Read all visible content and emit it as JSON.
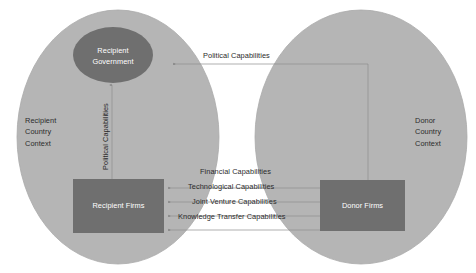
{
  "diagram": {
    "colors": {
      "ellipse_fill": "#b4b4b4",
      "ellipse_stroke": "#a8a8a8",
      "box_fill": "#6e6e6e",
      "circle_fill": "#6e6e6e",
      "line": "#8f8f8f",
      "text_dark": "#2b2b2b",
      "text_light": "#ffffff",
      "background": "#ffffff"
    },
    "containers": [
      {
        "id": "recipient-country-context",
        "label": "Recipient\nCountry\nContext",
        "label_lines": [
          "Recipient",
          "Country",
          "Context"
        ],
        "shape": "ellipse"
      },
      {
        "id": "donor-country-context",
        "label": "Donor\nCountry\nContext",
        "label_lines": [
          "Donor",
          "Country",
          "Context"
        ],
        "shape": "ellipse"
      }
    ],
    "nodes": [
      {
        "id": "recipient-government",
        "label_lines": [
          "Recipient",
          "Government"
        ],
        "shape": "ellipse"
      },
      {
        "id": "recipient-firms",
        "label_lines": [
          "Recipient Firms"
        ],
        "shape": "rectangle"
      },
      {
        "id": "donor-firms",
        "label_lines": [
          "Donor Firms"
        ],
        "shape": "rectangle"
      }
    ],
    "flows": [
      {
        "id": "political-capabilities-top",
        "label": "Political Capabilities",
        "from": "donor-country-context",
        "to": "recipient-government",
        "orientation": "horizontal"
      },
      {
        "id": "political-capabilities-vertical",
        "label": "Political Capabilities",
        "from": "recipient-firms",
        "to": "recipient-government",
        "orientation": "vertical"
      },
      {
        "id": "financial-capabilities",
        "label": "Financial Capabilities",
        "from": "donor-firms",
        "to": "recipient-firms",
        "orientation": "horizontal"
      },
      {
        "id": "technological-capabilities",
        "label": "Technological  Capabilities",
        "from": "donor-firms",
        "to": "recipient-firms",
        "orientation": "horizontal"
      },
      {
        "id": "joint-venture-capabilities",
        "label": "Joint Venture Capabilities",
        "from": "donor-firms",
        "to": "recipient-firms",
        "orientation": "horizontal"
      },
      {
        "id": "knowledge-transfer-capabilities",
        "label": "Knowledge Transfer  Capabilities",
        "from": "donor-firms",
        "to": "recipient-firms",
        "orientation": "horizontal"
      }
    ]
  }
}
